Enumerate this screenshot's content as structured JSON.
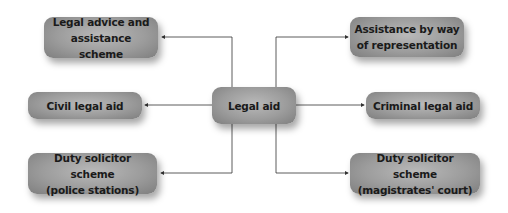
{
  "diagram": {
    "center": {
      "label": "Legal aid"
    },
    "left": [
      {
        "label": "Legal advice and\nassistance scheme"
      },
      {
        "label": "Civil legal aid"
      },
      {
        "label": "Duty solicitor scheme\n(police stations)"
      }
    ],
    "right": [
      {
        "label": "Assistance by way\nof representation"
      },
      {
        "label": "Criminal legal aid"
      },
      {
        "label": "Duty solicitor scheme\n(magistrates' court)"
      }
    ],
    "colors": {
      "node_fill_light": "#b9b9b9",
      "node_fill_dark": "#7e7e7e",
      "text": "#1a1a1a",
      "connector": "#333333",
      "background": "#ffffff"
    }
  }
}
